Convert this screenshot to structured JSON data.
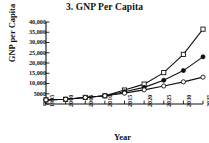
{
  "chart_data": {
    "type": "line",
    "title": "3. GNP Per Capita",
    "xlabel": "Year",
    "ylabel": "GNP per Capita",
    "x": [
      1995,
      2000,
      2005,
      2010,
      2015,
      2020,
      2025,
      2030,
      2035
    ],
    "xticklabels": [
      "1995",
      "2000",
      "2005",
      "2010",
      "2015",
      "2020",
      "2025",
      "2030",
      "2035"
    ],
    "yticks": [
      0,
      5000,
      10000,
      15000,
      20000,
      25000,
      30000,
      35000,
      40000
    ],
    "yticklabels": [
      "0",
      "5000",
      "10,000",
      "15,000",
      "20,000",
      "25,000",
      "30,000",
      "35,000",
      "40,000"
    ],
    "xlim": [
      1995,
      2035
    ],
    "ylim": [
      0,
      40000
    ],
    "grid": false,
    "legend": "none",
    "series": [
      {
        "name": "High growth scenario",
        "marker": "open-square",
        "values": [
          2000,
          2300,
          3200,
          4000,
          6800,
          9700,
          15300,
          24200,
          36500
        ]
      },
      {
        "name": "Medium growth scenario",
        "marker": "filled-circle",
        "values": [
          2000,
          2300,
          3200,
          4000,
          6000,
          8100,
          11600,
          16300,
          23000
        ]
      },
      {
        "name": "Low growth scenario",
        "marker": "open-circle",
        "values": [
          2000,
          2300,
          3200,
          4000,
          5300,
          6900,
          8800,
          10800,
          13100
        ]
      }
    ]
  }
}
